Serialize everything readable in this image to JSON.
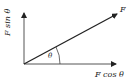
{
  "diagram": {
    "vectors": [
      {
        "name": "F",
        "label": "F"
      },
      {
        "name": "vertical-component",
        "label": "F sin θ"
      },
      {
        "name": "horizontal-component",
        "label": "F cos θ"
      }
    ],
    "angle_label": "θ",
    "colors": {
      "line": "#333333",
      "arrow": "#222222",
      "background": "#ffffff"
    }
  },
  "labels": {
    "force": "F",
    "sin": "F sin θ",
    "cos": "F cos θ",
    "theta": "θ"
  }
}
